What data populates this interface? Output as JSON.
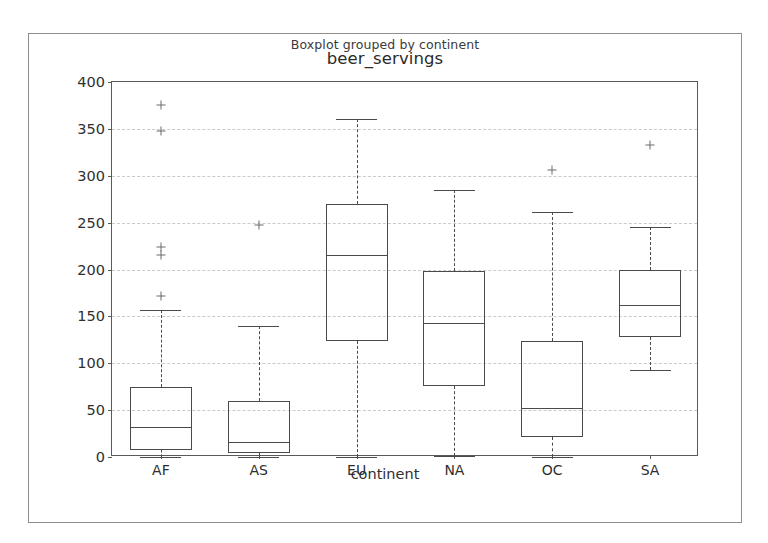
{
  "figure": {
    "suptitle": "Boxplot grouped by continent",
    "title": "beer_servings"
  },
  "chart_data": {
    "type": "box",
    "title": "beer_servings",
    "suptitle": "Boxplot grouped by continent",
    "xlabel": "continent",
    "ylabel": "",
    "ylim": [
      0,
      400
    ],
    "yticks": [
      0,
      50,
      100,
      150,
      200,
      250,
      300,
      350,
      400
    ],
    "ytick_labels": [
      "0",
      "50",
      "100",
      "150",
      "200",
      "250",
      "300",
      "350",
      "400"
    ],
    "grid": true,
    "legend": null,
    "categories": [
      "AF",
      "AS",
      "EU",
      "NA",
      "OC",
      "SA"
    ],
    "boxes": [
      {
        "category": "AF",
        "whisker_low": 0,
        "q1": 8,
        "median": 32,
        "q3": 75,
        "whisker_high": 157,
        "outliers": [
          172,
          216,
          224,
          348,
          376
        ]
      },
      {
        "category": "AS",
        "whisker_low": 0,
        "q1": 4,
        "median": 16,
        "q3": 60,
        "whisker_high": 140,
        "outliers": [
          247
        ]
      },
      {
        "category": "EU",
        "whisker_low": 0,
        "q1": 124,
        "median": 215,
        "q3": 270,
        "whisker_high": 361,
        "outliers": []
      },
      {
        "category": "NA",
        "whisker_low": 1,
        "q1": 76,
        "median": 143,
        "q3": 198,
        "whisker_high": 285,
        "outliers": []
      },
      {
        "category": "OC",
        "whisker_low": 0,
        "q1": 21,
        "median": 52,
        "q3": 124,
        "whisker_high": 261,
        "outliers": [
          306
        ]
      },
      {
        "category": "SA",
        "whisker_low": 93,
        "q1": 128,
        "median": 162,
        "q3": 199,
        "whisker_high": 245,
        "outliers": [
          333
        ]
      }
    ],
    "colors": {
      "box_edge": "#4a4a4a",
      "whisker": "#4a4a4a",
      "flier": "#6a6a6a",
      "grid": "#c9c9d2",
      "axes_edge": "#5a5a5a",
      "figure_edge": "#8e8e8e",
      "background": "#ffffff"
    }
  }
}
